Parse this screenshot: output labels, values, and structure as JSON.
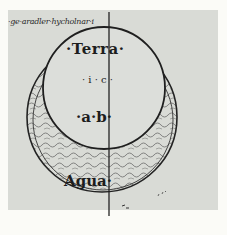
{
  "figure": {
    "header_text": "·ge·aradler·hycholnar·i",
    "labels": {
      "terra": "·Terra·",
      "ic": "· i · c ·",
      "ab": "·a·b·",
      "agua": "Agua·"
    },
    "colors": {
      "paper": "#d9dbd6",
      "ink": "#1d1d1d",
      "margin": "#fbfbf7"
    }
  }
}
